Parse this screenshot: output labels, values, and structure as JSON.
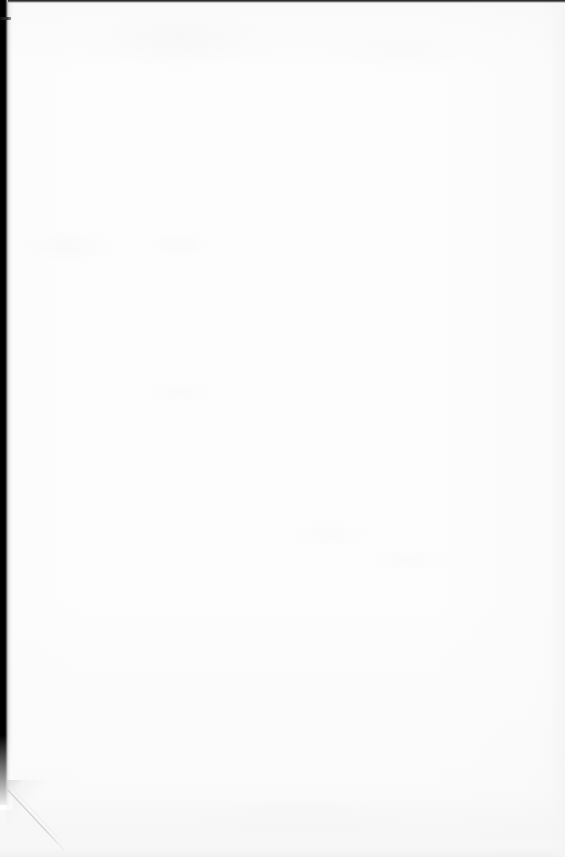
{
  "document": {
    "page_kind": "blank-scanned-page",
    "page_text": "",
    "visible_text_lines": [],
    "header_text": "",
    "footer_text": "",
    "page_number": "",
    "body_paragraphs": []
  },
  "canvas": {
    "width_px": 565,
    "height_px": 857
  },
  "paper": {
    "surface_color": "#fdfdfd",
    "background_color": "#ffffff",
    "texture_tint_color": "#f7f7f7"
  },
  "artifacts": {
    "gutter": {
      "name": "left-gutter-shadow",
      "color": "#000000",
      "edge_color": "#8f8f8f",
      "x_px": 0,
      "width_px": 13,
      "height_px": 805
    },
    "top_edge": {
      "name": "top-scan-edge-line",
      "color": "#1d1d1d",
      "y_px": 0,
      "height_px": 3
    },
    "edge_tick": {
      "name": "left-edge-tick-mark",
      "color": "#111111",
      "x_px": 0,
      "y_px": 17,
      "width_px": 11,
      "height_px": 3
    },
    "corner_shadow": {
      "name": "bottom-left-corner-shadow",
      "color": "#bebebe",
      "x_px": 6,
      "y_px": 780
    },
    "bottom_edge": {
      "name": "bottom-edge-tint",
      "color": "#f1f1f1",
      "height_px": 26
    },
    "right_edge": {
      "name": "right-edge-tint",
      "color": "#f5f5f5",
      "width_px": 14
    }
  }
}
